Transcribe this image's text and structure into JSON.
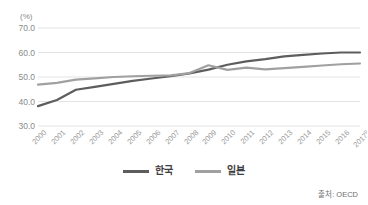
{
  "axis": {
    "unit_label": "(%)",
    "y_ticks": [
      "70.0",
      "60.0",
      "50.0",
      "40.0",
      "30.0"
    ],
    "y_min": 30.0,
    "y_max": 70.0
  },
  "legend": {
    "items": [
      {
        "label": "한국",
        "color": "#5d5d5d",
        "icon": "line-swatch-icon"
      },
      {
        "label": "일본",
        "color": "#a0a0a0",
        "icon": "line-swatch-icon"
      }
    ]
  },
  "source": {
    "text": "출처: OECD"
  },
  "chart_data": {
    "type": "line",
    "title": "",
    "subtitle": "",
    "xlabel": "",
    "ylabel": "(%)",
    "ylim": [
      30.0,
      70.0
    ],
    "y_ticks": [
      30.0,
      40.0,
      50.0,
      60.0,
      70.0
    ],
    "grid": true,
    "grid_axis": "horizontal",
    "legend_position": "bottom-center",
    "source": "출처: OECD",
    "categories": [
      "2000",
      "2001",
      "2002",
      "2003",
      "2004",
      "2005",
      "2006",
      "2007",
      "2008",
      "2009",
      "2010",
      "2011",
      "2012",
      "2013",
      "2014",
      "2015",
      "2016",
      "2017"
    ],
    "category_notes": {
      "2017": "p"
    },
    "series": [
      {
        "name": "한국",
        "color": "#5d5d5d",
        "values": [
          38.1,
          40.6,
          44.8,
          46.0,
          47.2,
          48.4,
          49.4,
          50.3,
          51.5,
          53.0,
          55.0,
          56.4,
          57.3,
          58.4,
          59.0,
          59.6,
          60.0,
          60.0
        ]
      },
      {
        "name": "일본",
        "color": "#a0a0a0",
        "values": [
          46.9,
          47.6,
          48.9,
          49.4,
          50.0,
          50.3,
          50.5,
          50.7,
          51.6,
          54.8,
          52.9,
          53.8,
          53.1,
          53.6,
          54.1,
          54.7,
          55.2,
          55.5
        ]
      }
    ]
  }
}
